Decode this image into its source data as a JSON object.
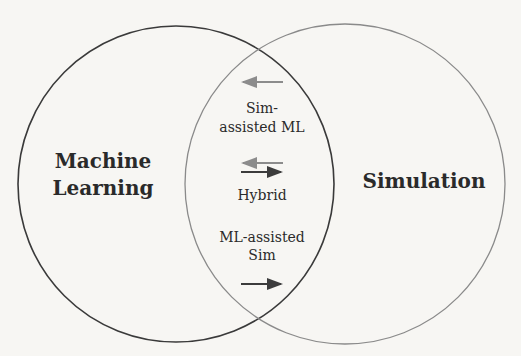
{
  "diagram": {
    "type": "venn",
    "sets": [
      {
        "id": "ml",
        "label_line1": "Machine",
        "label_line2": "Learning",
        "stroke": "#3a3a3a"
      },
      {
        "id": "sim",
        "label": "Simulation",
        "stroke": "#8a8a8a"
      }
    ],
    "intersection": {
      "regions": [
        {
          "label_line1": "Sim-",
          "label_line2": "assisted ML",
          "arrow": "left"
        },
        {
          "label": "Hybrid",
          "arrow": "both"
        },
        {
          "label_line1": "ML-assisted",
          "label_line2": "Sim",
          "arrow": "right"
        }
      ]
    },
    "colors": {
      "background": "#f7f6f3",
      "arrow_light": "#8c8c8c",
      "arrow_dark": "#3c3c3c",
      "text": "#2a2a2a"
    }
  }
}
